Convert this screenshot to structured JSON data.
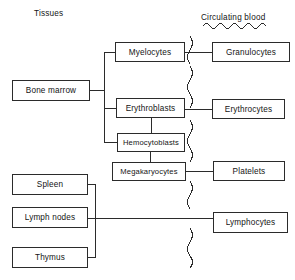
{
  "figure": {
    "width": 295,
    "height": 280,
    "background": "#ffffff",
    "line_color": "#2b2b2b",
    "text_color": "#141414"
  },
  "labels": {
    "tissues": "Tissues",
    "circulating_blood": "Circulating blood"
  },
  "nodes": {
    "bone_marrow": "Bone marrow",
    "myelocytes": "Myelocytes",
    "erythroblasts": "Erythroblasts",
    "hemocytoblasts": "Hemocytoblasts",
    "megakaryocytes": "Megakaryocytes",
    "granulocytes": "Granulocytes",
    "erythrocytes": "Erythrocytes",
    "platelets": "Platelets",
    "spleen": "Spleen",
    "lymph_nodes": "Lymph nodes",
    "thymus": "Thymus",
    "lymphocytes": "Lymphocytes"
  },
  "connections": [
    {
      "from": "bone_marrow",
      "to": "myelocytes"
    },
    {
      "from": "bone_marrow",
      "to": "erythroblasts"
    },
    {
      "from": "bone_marrow",
      "to": "hemocytoblasts"
    },
    {
      "from": "hemocytoblasts",
      "to": "erythroblasts"
    },
    {
      "from": "hemocytoblasts",
      "to": "megakaryocytes"
    },
    {
      "from": "myelocytes",
      "to": "granulocytes"
    },
    {
      "from": "erythroblasts",
      "to": "erythrocytes"
    },
    {
      "from": "megakaryocytes",
      "to": "platelets"
    },
    {
      "from": "spleen",
      "to": "lymphocytes"
    },
    {
      "from": "lymph_nodes",
      "to": "lymphocytes"
    },
    {
      "from": "thymus",
      "to": "lymphocytes"
    }
  ],
  "boundary": {
    "name": "circulating-blood-boundary",
    "style": "wavy-vertical-line",
    "x": 190
  }
}
